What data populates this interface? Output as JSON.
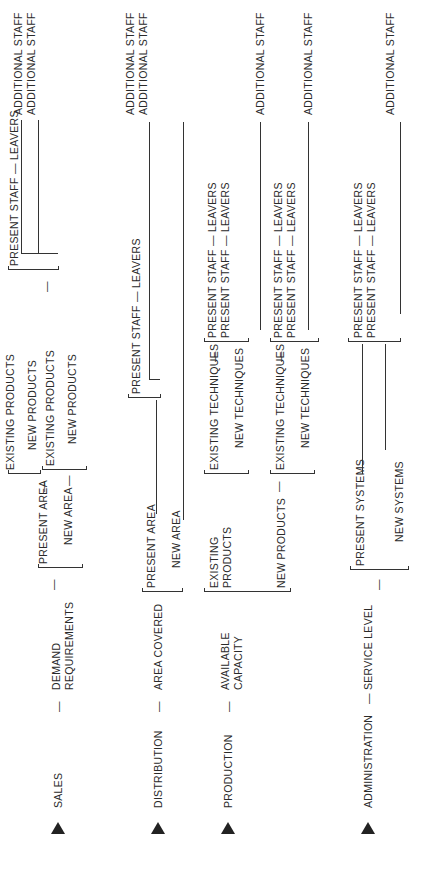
{
  "diagram": {
    "type": "hierarchical-bracket-tree",
    "orientation": "rotated 90 degrees counter-clockwise",
    "functions": [
      {
        "name": "SALES",
        "driver": "DEMAND REQUIREMENTS",
        "driver_line1": "DEMAND",
        "driver_line2": "REQUIREMENTS",
        "branches": [
          {
            "label": "PRESENT AREA",
            "sub": [
              "EXISTING PRODUCTS",
              "NEW PRODUCTS"
            ]
          },
          {
            "label": "NEW AREA",
            "sub": [
              "EXISTING PRODUCTS",
              "NEW PRODUCTS"
            ]
          }
        ]
      },
      {
        "name": "DISTRIBUTION",
        "driver": "AREA COVERED",
        "branches": [
          {
            "label": "PRESENT AREA"
          },
          {
            "label": "NEW AREA"
          }
        ]
      },
      {
        "name": "PRODUCTION",
        "driver": "AVAILABLE CAPACITY",
        "driver_line1": "AVAILABLE",
        "driver_line2": "CAPACITY",
        "branches": [
          {
            "label": "EXISTING PRODUCTS",
            "label_line1": "EXISTING",
            "label_line2": "PRODUCTS",
            "sub": [
              "EXISTING TECHNIQUES",
              "NEW TECHNIQUES"
            ]
          },
          {
            "label": "NEW PRODUCTS",
            "sub": [
              "EXISTING TECHNIQUES",
              "NEW TECHNIQUES"
            ]
          }
        ]
      },
      {
        "name": "ADMINISTRATION",
        "driver": "SERVICE LEVEL",
        "branches": [
          {
            "label": "PRESENT SYSTEMS"
          },
          {
            "label": "NEW SYSTEMS"
          }
        ]
      }
    ],
    "staffing": {
      "present_staff_leavers": "PRESENT STAFF — LEAVERS",
      "additional_staff": "ADDITIONAL STAFF"
    },
    "dash": "—"
  }
}
